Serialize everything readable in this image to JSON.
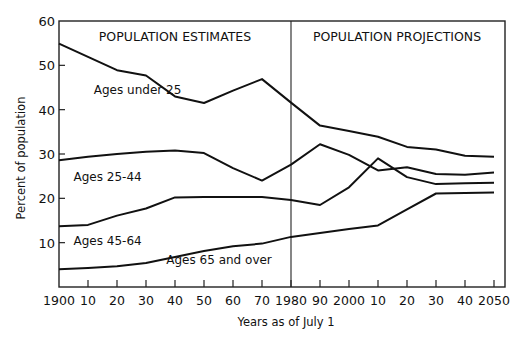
{
  "chart_data": {
    "type": "line",
    "title": "",
    "panel_labels": [
      "POPULATION ESTIMATES",
      "POPULATION PROJECTIONS"
    ],
    "divider_year": 1980,
    "xlabel": "Years as of July 1",
    "ylabel": "Percent of population",
    "ylim": [
      0,
      60
    ],
    "xlim": [
      1900,
      2055
    ],
    "yticks": [
      10,
      20,
      30,
      40,
      50,
      60
    ],
    "ytick_labels": [
      "10",
      "20",
      "30",
      "40",
      "50",
      "60"
    ],
    "xticks": [
      1900,
      1910,
      1920,
      1930,
      1940,
      1950,
      1960,
      1970,
      1980,
      1990,
      2000,
      2010,
      2020,
      2030,
      2040,
      2050
    ],
    "xtick_labels": [
      "1900",
      "10",
      "20",
      "30",
      "40",
      "50",
      "60",
      "70",
      "1980",
      "90",
      "2000",
      "10",
      "20",
      "30",
      "40",
      "2050"
    ],
    "grid": false,
    "legend": "inline labels",
    "series": [
      {
        "name": "Ages under 25",
        "x": [
          1900,
          1910,
          1920,
          1930,
          1940,
          1950,
          1960,
          1970,
          1980,
          1990,
          2000,
          2010,
          2020,
          2030,
          2040,
          2050
        ],
        "values": [
          54.9,
          51.9,
          48.9,
          47.7,
          43.0,
          41.5,
          44.3,
          46.9,
          41.6,
          36.4,
          35.2,
          33.9,
          31.6,
          31.0,
          29.6,
          29.4
        ]
      },
      {
        "name": "Ages 25-44",
        "x": [
          1900,
          1910,
          1920,
          1930,
          1940,
          1950,
          1960,
          1970,
          1980,
          1990,
          2000,
          2010,
          2020,
          2030,
          2040,
          2050
        ],
        "values": [
          28.6,
          29.4,
          30.0,
          30.5,
          30.8,
          30.2,
          26.8,
          24.0,
          27.6,
          32.2,
          29.8,
          26.3,
          27.0,
          25.5,
          25.3,
          25.8
        ]
      },
      {
        "name": "Ages 45-64",
        "x": [
          1900,
          1910,
          1920,
          1930,
          1940,
          1950,
          1960,
          1970,
          1980,
          1990,
          2000,
          2010,
          2020,
          2030,
          2040,
          2050
        ],
        "values": [
          13.7,
          14.0,
          16.1,
          17.7,
          20.2,
          20.3,
          20.3,
          20.3,
          19.6,
          18.5,
          22.5,
          29.0,
          24.8,
          23.2,
          23.4,
          23.5
        ]
      },
      {
        "name": "Ages 65 and over",
        "x": [
          1900,
          1910,
          1920,
          1930,
          1940,
          1950,
          1960,
          1970,
          1980,
          1990,
          2000,
          2010,
          2020,
          2030,
          2040,
          2050
        ],
        "values": [
          4.0,
          4.3,
          4.7,
          5.4,
          6.8,
          8.1,
          9.2,
          9.8,
          11.3,
          12.2,
          13.1,
          13.9,
          17.5,
          21.1,
          21.2,
          21.3
        ]
      }
    ],
    "series_label_positions": [
      {
        "name": "Ages under 25",
        "x": 1912,
        "y": 43.5
      },
      {
        "name": "Ages 25-44",
        "x": 1905,
        "y": 24.0
      },
      {
        "name": "Ages 45-64",
        "x": 1905,
        "y": 9.5
      },
      {
        "name": "Ages 65 and over",
        "x": 1937,
        "y": 5.3
      }
    ]
  },
  "ui": {
    "axis_color": "#222222",
    "line_color": "#111111",
    "background": "#ffffff"
  }
}
